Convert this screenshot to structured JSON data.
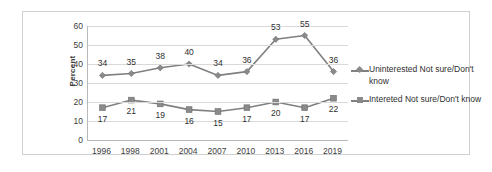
{
  "chart_data": {
    "type": "line",
    "title": "",
    "xlabel": "",
    "ylabel": "Percent",
    "ylim": [
      0,
      60
    ],
    "yticks": [
      0,
      10,
      20,
      30,
      40,
      50,
      60
    ],
    "grid": true,
    "legend_position": "right",
    "categories": [
      "1996",
      "1998",
      "2001",
      "2004",
      "2007",
      "2010",
      "2013",
      "2016",
      "2019"
    ],
    "series": [
      {
        "name": "Uninterested  Not sure/Don't know",
        "marker": "diamond",
        "color": "#808080",
        "values": [
          34,
          35,
          38,
          40,
          34,
          36,
          53,
          55,
          36
        ]
      },
      {
        "name": "Intereted Not sure/Don't know",
        "marker": "square",
        "color": "#808080",
        "values": [
          17,
          21,
          19,
          16,
          15,
          17,
          20,
          17,
          22
        ]
      }
    ]
  }
}
